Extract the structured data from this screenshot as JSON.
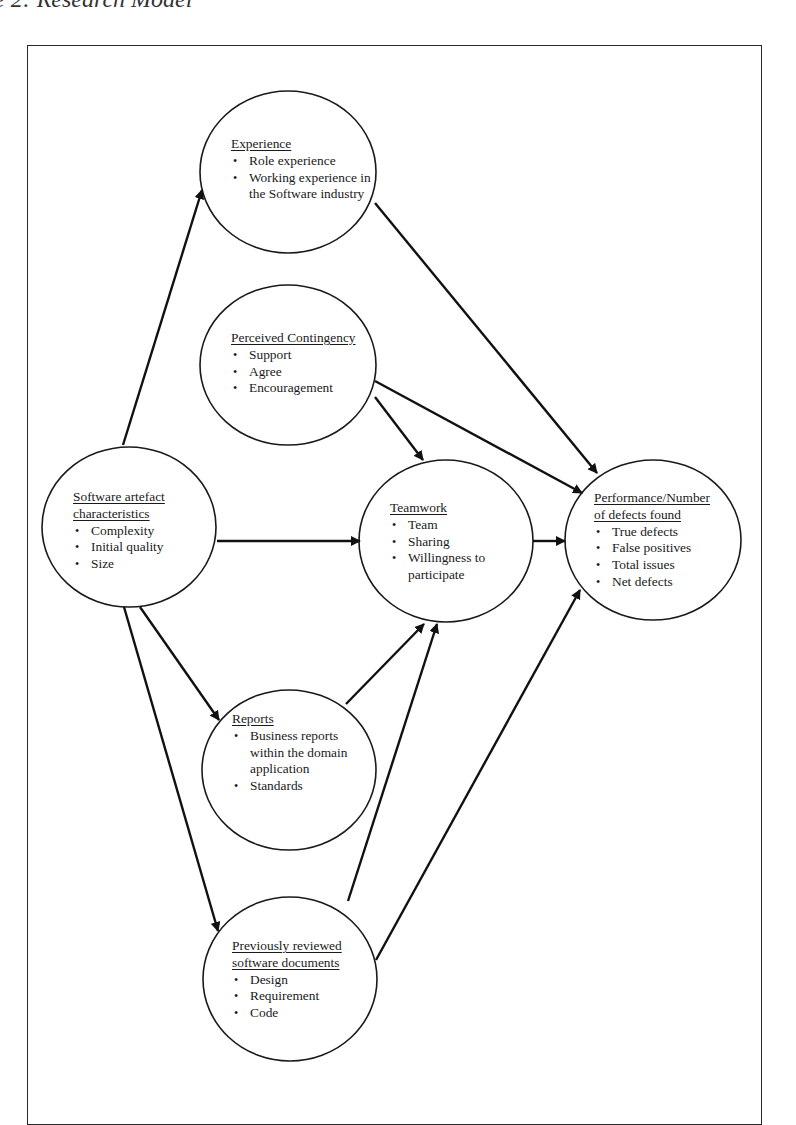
{
  "caption": "e 2: Research Model",
  "nodes": {
    "experience": {
      "title": "Experience",
      "items": [
        "Role experience",
        "Working experience in the Software industry"
      ],
      "ellipse": {
        "cx": 288,
        "cy": 172,
        "rx": 88,
        "ry": 81
      }
    },
    "perceived_contingency": {
      "title": "Perceived Contingency",
      "items": [
        "Support",
        "Agree",
        "Encouragement"
      ],
      "ellipse": {
        "cx": 288,
        "cy": 365,
        "rx": 88,
        "ry": 80
      }
    },
    "software_artefact": {
      "title": "Software artefact characteristics",
      "items": [
        "Complexity",
        "Initial quality",
        "Size"
      ],
      "ellipse": {
        "cx": 129,
        "cy": 527,
        "rx": 87,
        "ry": 80
      }
    },
    "teamwork": {
      "title": "Teamwork",
      "items": [
        "Team",
        "Sharing",
        "Willingness to participate"
      ],
      "ellipse": {
        "cx": 446,
        "cy": 541,
        "rx": 87,
        "ry": 81
      }
    },
    "performance": {
      "title": "Performance/Number of defects found",
      "items": [
        "True defects",
        "False positives",
        "Total issues",
        "Net defects"
      ],
      "ellipse": {
        "cx": 653,
        "cy": 540,
        "rx": 88,
        "ry": 80
      }
    },
    "reports": {
      "title": "Reports",
      "items": [
        "Business reports within the domain application",
        "Standards"
      ],
      "ellipse": {
        "cx": 289,
        "cy": 770,
        "rx": 87,
        "ry": 80
      }
    },
    "previously_reviewed": {
      "title": "Previously reviewed software documents",
      "items": [
        "Design",
        "Requirement",
        "Code"
      ],
      "ellipse": {
        "cx": 290,
        "cy": 979,
        "rx": 87,
        "ry": 82
      }
    }
  },
  "edges": [
    {
      "from": "software_artefact",
      "to": "experience",
      "x1": 123,
      "y1": 445,
      "x2": 202,
      "y2": 190
    },
    {
      "from": "experience",
      "to": "performance",
      "x1": 375,
      "y1": 203,
      "x2": 597,
      "y2": 473
    },
    {
      "from": "perceived_contingency",
      "to": "performance",
      "x1": 375,
      "y1": 381,
      "x2": 582,
      "y2": 493
    },
    {
      "from": "perceived_contingency",
      "to": "teamwork",
      "x1": 375,
      "y1": 397,
      "x2": 423,
      "y2": 460
    },
    {
      "from": "software_artefact",
      "to": "teamwork",
      "x1": 217,
      "y1": 541,
      "x2": 360,
      "y2": 541
    },
    {
      "from": "teamwork",
      "to": "performance",
      "x1": 533,
      "y1": 541,
      "x2": 565,
      "y2": 541
    },
    {
      "from": "software_artefact",
      "to": "reports",
      "x1": 140,
      "y1": 607,
      "x2": 219,
      "y2": 720
    },
    {
      "from": "software_artefact",
      "to": "previously_reviewed",
      "x1": 124,
      "y1": 607,
      "x2": 218,
      "y2": 931
    },
    {
      "from": "reports",
      "to": "teamwork",
      "x1": 346,
      "y1": 704,
      "x2": 424,
      "y2": 624
    },
    {
      "from": "previously_reviewed",
      "to": "teamwork",
      "x1": 348,
      "y1": 901,
      "x2": 437,
      "y2": 624
    },
    {
      "from": "previously_reviewed",
      "to": "performance",
      "x1": 376,
      "y1": 960,
      "x2": 580,
      "y2": 590
    }
  ]
}
